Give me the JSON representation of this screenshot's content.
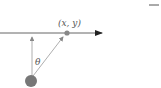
{
  "diagram": {
    "point_label": "(x, y)",
    "angle_label": "θ",
    "colors": {
      "line": "#555555",
      "point": "#888888",
      "origin": "#777777",
      "arrow": "#999999"
    }
  }
}
